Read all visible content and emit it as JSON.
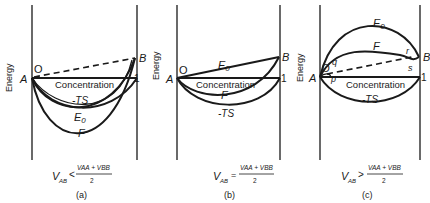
{
  "panels": [
    {
      "id": "a",
      "caption": "(a)",
      "y_axis_label": "Energy",
      "x_axis_label": "Concentration",
      "start_label": "A",
      "end_label": "B",
      "origin_label": "O",
      "unit_label": "1",
      "curves": [
        "-TS",
        "E0",
        "F"
      ],
      "condition": {
        "lhs": "V",
        "lhs_sub": "AB",
        "relation": "<",
        "numerator": "VAA + VBB",
        "denominator": "2"
      }
    },
    {
      "id": "b",
      "caption": "(b)",
      "y_axis_label": "Energy",
      "x_axis_label": "Concentration",
      "start_label": "A",
      "end_label": "B",
      "origin_label": "O",
      "unit_label": "1",
      "curves": [
        "E0",
        "F",
        "-TS"
      ],
      "condition": {
        "lhs": "V",
        "lhs_sub": "AB",
        "relation": "=",
        "numerator": "VAA + VBB",
        "denominator": "2"
      }
    },
    {
      "id": "c",
      "caption": "(c)",
      "y_axis_label": "Energy",
      "x_axis_label": "Concentration",
      "start_label": "A",
      "end_label": "B",
      "origin_label": "O",
      "unit_label": "1",
      "curves": [
        "E0",
        "F",
        "-TS"
      ],
      "points": [
        "p",
        "q",
        "r",
        "s"
      ],
      "condition": {
        "lhs": "V",
        "lhs_sub": "AB",
        "relation": ">",
        "numerator": "VAA + VBB",
        "denominator": "2"
      }
    }
  ],
  "labels": {
    "energy": "Energy",
    "concentration": "Concentration",
    "A": "A",
    "B": "B",
    "O": "O",
    "one": "1",
    "E": "E",
    "E_sub": "0",
    "F": "F",
    "TS": "-TS",
    "p": "p",
    "q": "q",
    "r": "r",
    "s": "s",
    "V": "V",
    "AB": "AB",
    "num": "VAA + VBB",
    "den": "2",
    "lt": "<",
    "eq": "=",
    "gt": ">",
    "cap_a": "(a)",
    "cap_b": "(b)",
    "cap_c": "(c)"
  }
}
